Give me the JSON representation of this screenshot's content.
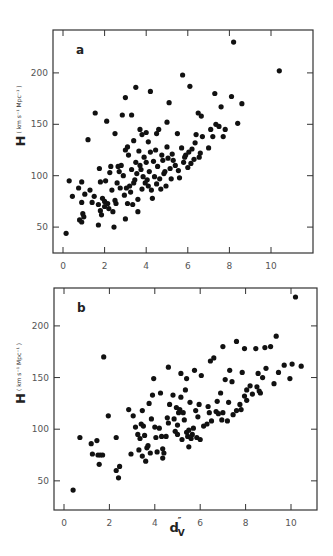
{
  "figure": {
    "y_label_main": "H",
    "y_label_units": "( km s⁻¹ Mpc⁻¹ )",
    "x_label": "d",
    "x_label_sub": "V",
    "x_label_sup": "″"
  },
  "chart_data": [
    {
      "type": "scatter",
      "panel": "a",
      "title": "a",
      "xlabel": "",
      "ylabel": "H ( km s^-1 Mpc^-1 )",
      "xlim": [
        -0.5,
        12
      ],
      "ylim": [
        25,
        238
      ],
      "xticks": [
        0,
        2,
        4,
        6,
        8,
        10
      ],
      "yticks": [
        50,
        100,
        150,
        200
      ],
      "grid": false,
      "frame": {
        "left": 53,
        "right": 313,
        "top": 30,
        "bottom": 253
      },
      "xmap": {
        "px0": 63,
        "pxPerUnit": 20.8
      },
      "ymap": {
        "px0": 278.5,
        "pxPerUnit": 1.028
      },
      "points": [
        [
          0.15,
          44
        ],
        [
          0.3,
          95
        ],
        [
          0.45,
          80
        ],
        [
          0.8,
          57
        ],
        [
          0.9,
          55
        ],
        [
          0.9,
          94
        ],
        [
          0.9,
          74
        ],
        [
          0.95,
          63
        ],
        [
          1.0,
          60
        ],
        [
          1.05,
          82
        ],
        [
          0.75,
          88
        ],
        [
          1.2,
          135
        ],
        [
          1.3,
          86
        ],
        [
          1.4,
          74
        ],
        [
          1.5,
          80
        ],
        [
          1.55,
          161
        ],
        [
          1.7,
          52
        ],
        [
          1.7,
          72
        ],
        [
          1.75,
          107
        ],
        [
          1.8,
          94
        ],
        [
          1.8,
          66
        ],
        [
          1.85,
          62
        ],
        [
          1.9,
          78
        ],
        [
          2.0,
          75
        ],
        [
          2.0,
          70
        ],
        [
          2.05,
          95
        ],
        [
          2.1,
          153
        ],
        [
          2.15,
          73
        ],
        [
          2.2,
          68
        ],
        [
          2.25,
          103
        ],
        [
          2.3,
          109
        ],
        [
          2.35,
          86
        ],
        [
          2.4,
          65
        ],
        [
          2.45,
          50
        ],
        [
          2.5,
          141
        ],
        [
          2.5,
          76
        ],
        [
          2.55,
          73
        ],
        [
          2.6,
          93
        ],
        [
          2.65,
          109
        ],
        [
          2.7,
          104
        ],
        [
          2.75,
          88
        ],
        [
          2.8,
          110
        ],
        [
          2.85,
          159
        ],
        [
          2.9,
          100
        ],
        [
          2.95,
          81
        ],
        [
          3.0,
          176
        ],
        [
          3.0,
          58
        ],
        [
          3.0,
          125
        ],
        [
          3.05,
          88
        ],
        [
          3.1,
          128
        ],
        [
          3.1,
          73
        ],
        [
          3.15,
          120
        ],
        [
          3.2,
          90
        ],
        [
          3.25,
          84
        ],
        [
          3.3,
          159
        ],
        [
          3.3,
          106
        ],
        [
          3.35,
          72
        ],
        [
          3.4,
          134
        ],
        [
          3.4,
          93
        ],
        [
          3.45,
          96
        ],
        [
          3.5,
          186
        ],
        [
          3.5,
          113
        ],
        [
          3.55,
          102
        ],
        [
          3.6,
          77
        ],
        [
          3.6,
          65
        ],
        [
          3.65,
          124
        ],
        [
          3.7,
          145
        ],
        [
          3.7,
          110
        ],
        [
          3.75,
          106
        ],
        [
          3.8,
          140
        ],
        [
          3.8,
          87
        ],
        [
          3.85,
          99
        ],
        [
          3.9,
          118
        ],
        [
          3.95,
          93
        ],
        [
          4.0,
          142
        ],
        [
          4.0,
          113
        ],
        [
          4.05,
          96
        ],
        [
          4.1,
          133
        ],
        [
          4.1,
          90
        ],
        [
          4.15,
          104
        ],
        [
          4.2,
          182
        ],
        [
          4.2,
          123
        ],
        [
          4.25,
          86
        ],
        [
          4.3,
          78
        ],
        [
          4.35,
          114
        ],
        [
          4.4,
          99
        ],
        [
          4.45,
          125
        ],
        [
          4.5,
          141
        ],
        [
          4.5,
          92
        ],
        [
          4.55,
          109
        ],
        [
          4.6,
          145
        ],
        [
          4.65,
          97
        ],
        [
          4.7,
          87
        ],
        [
          4.75,
          120
        ],
        [
          4.8,
          115
        ],
        [
          4.85,
          102
        ],
        [
          4.9,
          104
        ],
        [
          4.95,
          90
        ],
        [
          5.0,
          128
        ],
        [
          5.0,
          152
        ],
        [
          5.05,
          117
        ],
        [
          5.1,
          171
        ],
        [
          5.15,
          107
        ],
        [
          5.2,
          97
        ],
        [
          5.25,
          121
        ],
        [
          5.3,
          115
        ],
        [
          5.4,
          110
        ],
        [
          5.5,
          141
        ],
        [
          5.55,
          105
        ],
        [
          5.6,
          98
        ],
        [
          5.7,
          127
        ],
        [
          5.75,
          198
        ],
        [
          5.8,
          113
        ],
        [
          5.85,
          118
        ],
        [
          5.9,
          120
        ],
        [
          6.0,
          108
        ],
        [
          6.05,
          123
        ],
        [
          6.1,
          187
        ],
        [
          6.15,
          112
        ],
        [
          6.2,
          126
        ],
        [
          6.3,
          116
        ],
        [
          6.35,
          132
        ],
        [
          6.4,
          140
        ],
        [
          6.5,
          161
        ],
        [
          6.55,
          118
        ],
        [
          6.6,
          122
        ],
        [
          6.65,
          158
        ],
        [
          6.7,
          138
        ],
        [
          7.0,
          127
        ],
        [
          7.1,
          145
        ],
        [
          7.2,
          138
        ],
        [
          7.3,
          180
        ],
        [
          7.35,
          150
        ],
        [
          7.5,
          148
        ],
        [
          7.6,
          167
        ],
        [
          7.7,
          138
        ],
        [
          7.8,
          145
        ],
        [
          8.1,
          177
        ],
        [
          8.2,
          230
        ],
        [
          8.4,
          151
        ],
        [
          8.6,
          170
        ],
        [
          10.4,
          202
        ]
      ]
    },
    {
      "type": "scatter",
      "panel": "b",
      "title": "b",
      "xlabel": "d_V''",
      "ylabel": "H ( km s^-1 Mpc^-1 )",
      "xlim": [
        -0.45,
        11.1
      ],
      "ylim": [
        22,
        237
      ],
      "xticks": [
        0,
        2,
        4,
        6,
        8,
        10
      ],
      "yticks": [
        50,
        100,
        150,
        200
      ],
      "grid": false,
      "frame": {
        "left": 54,
        "right": 317,
        "top": 288,
        "bottom": 510
      },
      "xmap": {
        "px0": 64,
        "pxPerUnit": 22.7
      },
      "ymap": {
        "px0": 532.5,
        "pxPerUnit": 1.033
      },
      "points": [
        [
          0.4,
          41
        ],
        [
          0.7,
          92
        ],
        [
          1.2,
          86
        ],
        [
          1.25,
          76
        ],
        [
          1.45,
          89
        ],
        [
          1.5,
          75
        ],
        [
          1.55,
          66
        ],
        [
          1.6,
          75
        ],
        [
          1.7,
          75
        ],
        [
          1.75,
          170
        ],
        [
          1.95,
          113
        ],
        [
          2.3,
          92
        ],
        [
          2.3,
          60
        ],
        [
          2.4,
          53
        ],
        [
          2.45,
          64
        ],
        [
          2.85,
          119
        ],
        [
          2.95,
          76
        ],
        [
          3.05,
          113
        ],
        [
          3.15,
          102
        ],
        [
          3.25,
          95
        ],
        [
          3.3,
          80
        ],
        [
          3.35,
          91
        ],
        [
          3.4,
          105
        ],
        [
          3.45,
          74
        ],
        [
          3.45,
          118
        ],
        [
          3.5,
          103
        ],
        [
          3.55,
          94
        ],
        [
          3.6,
          69
        ],
        [
          3.65,
          82
        ],
        [
          3.7,
          84
        ],
        [
          3.75,
          125
        ],
        [
          3.8,
          77
        ],
        [
          3.85,
          110
        ],
        [
          3.9,
          133
        ],
        [
          3.95,
          149
        ],
        [
          4.0,
          102
        ],
        [
          4.05,
          92
        ],
        [
          4.1,
          78
        ],
        [
          4.2,
          101
        ],
        [
          4.25,
          135
        ],
        [
          4.3,
          93
        ],
        [
          4.35,
          81
        ],
        [
          4.35,
          72
        ],
        [
          4.4,
          77
        ],
        [
          4.5,
          93
        ],
        [
          4.55,
          111
        ],
        [
          4.6,
          160
        ],
        [
          4.6,
          106
        ],
        [
          4.65,
          124
        ],
        [
          4.8,
          133
        ],
        [
          4.85,
          110
        ],
        [
          4.9,
          98
        ],
        [
          4.95,
          121
        ],
        [
          5.0,
          104
        ],
        [
          5.0,
          95
        ],
        [
          5.05,
          116
        ],
        [
          5.1,
          119
        ],
        [
          5.15,
          131
        ],
        [
          5.15,
          154
        ],
        [
          5.2,
          90
        ],
        [
          5.25,
          116
        ],
        [
          5.3,
          109
        ],
        [
          5.35,
          138
        ],
        [
          5.4,
          149
        ],
        [
          5.4,
          97
        ],
        [
          5.45,
          93
        ],
        [
          5.5,
          99
        ],
        [
          5.5,
          83
        ],
        [
          5.55,
          126
        ],
        [
          5.6,
          91
        ],
        [
          5.65,
          95
        ],
        [
          5.7,
          101
        ],
        [
          5.75,
          157
        ],
        [
          5.8,
          118
        ],
        [
          5.85,
          92
        ],
        [
          5.9,
          112
        ],
        [
          5.95,
          124
        ],
        [
          6.0,
          90
        ],
        [
          6.05,
          152
        ],
        [
          6.15,
          103
        ],
        [
          6.3,
          105
        ],
        [
          6.35,
          122
        ],
        [
          6.4,
          116
        ],
        [
          6.45,
          166
        ],
        [
          6.5,
          108
        ],
        [
          6.6,
          169
        ],
        [
          6.7,
          117
        ],
        [
          6.75,
          127
        ],
        [
          6.8,
          115
        ],
        [
          6.9,
          135
        ],
        [
          6.95,
          109
        ],
        [
          7.0,
          116
        ],
        [
          7.0,
          180
        ],
        [
          7.1,
          148
        ],
        [
          7.2,
          108
        ],
        [
          7.25,
          126
        ],
        [
          7.3,
          157
        ],
        [
          7.4,
          146
        ],
        [
          7.45,
          114
        ],
        [
          7.6,
          118
        ],
        [
          7.6,
          185
        ],
        [
          7.75,
          124
        ],
        [
          7.8,
          119
        ],
        [
          7.85,
          155
        ],
        [
          7.95,
          132
        ],
        [
          7.95,
          178
        ],
        [
          8.05,
          138
        ],
        [
          8.05,
          128
        ],
        [
          8.2,
          142
        ],
        [
          8.3,
          134
        ],
        [
          8.45,
          178
        ],
        [
          8.5,
          141
        ],
        [
          8.55,
          154
        ],
        [
          8.6,
          137
        ],
        [
          8.65,
          135
        ],
        [
          8.75,
          150
        ],
        [
          8.85,
          179
        ],
        [
          8.9,
          159
        ],
        [
          9.1,
          180
        ],
        [
          9.25,
          144
        ],
        [
          9.35,
          190
        ],
        [
          9.45,
          155
        ],
        [
          9.7,
          162
        ],
        [
          9.95,
          149
        ],
        [
          10.05,
          163
        ],
        [
          10.2,
          228
        ],
        [
          10.45,
          161
        ]
      ]
    }
  ]
}
